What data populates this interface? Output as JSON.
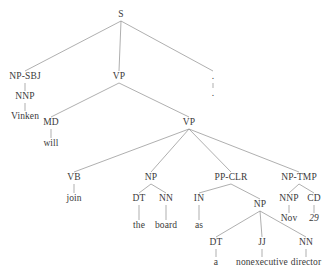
{
  "figure": {
    "type": "constituency-parse-tree",
    "sentence": "Vinken will join the board as a nonexecutive director Nov. 29 .",
    "background_color": "#ffffff",
    "line_color": "#8c8c8c",
    "text_color": "#3a3a3a"
  },
  "nodes": [
    {
      "id": "s",
      "label": "S",
      "kind": "nonterminal",
      "x": 121,
      "y": 15
    },
    {
      "id": "np-sbj",
      "label": "NP-SBJ",
      "kind": "nonterminal",
      "x": 25,
      "y": 77
    },
    {
      "id": "nnp-vinken",
      "label": "NNP",
      "kind": "nonterminal",
      "x": 25,
      "y": 97
    },
    {
      "id": "w-vinken",
      "label": "Vinken",
      "kind": "terminal",
      "x": 25,
      "y": 117
    },
    {
      "id": "vp-outer",
      "label": "VP",
      "kind": "nonterminal",
      "x": 119,
      "y": 77
    },
    {
      "id": "md",
      "label": "MD",
      "kind": "nonterminal",
      "x": 51,
      "y": 123
    },
    {
      "id": "w-will",
      "label": "will",
      "kind": "terminal",
      "x": 51,
      "y": 144
    },
    {
      "id": "vp-inner",
      "label": "VP",
      "kind": "nonterminal",
      "x": 189,
      "y": 123
    },
    {
      "id": "vb",
      "label": "VB",
      "kind": "nonterminal",
      "x": 74,
      "y": 178
    },
    {
      "id": "w-join",
      "label": "join",
      "kind": "terminal",
      "x": 74,
      "y": 199
    },
    {
      "id": "np-obj",
      "label": "NP",
      "kind": "nonterminal",
      "x": 151,
      "y": 178
    },
    {
      "id": "dt-the",
      "label": "DT",
      "kind": "nonterminal",
      "x": 139,
      "y": 199
    },
    {
      "id": "w-the",
      "label": "the",
      "kind": "terminal",
      "x": 139,
      "y": 226
    },
    {
      "id": "nn-board",
      "label": "NN",
      "kind": "nonterminal",
      "x": 166,
      "y": 199
    },
    {
      "id": "w-board",
      "label": "board",
      "kind": "terminal",
      "x": 166,
      "y": 226
    },
    {
      "id": "pp-clr",
      "label": "PP-CLR",
      "kind": "nonterminal",
      "x": 231,
      "y": 178
    },
    {
      "id": "in-as",
      "label": "IN",
      "kind": "nonterminal",
      "x": 199,
      "y": 199
    },
    {
      "id": "w-as",
      "label": "as",
      "kind": "terminal",
      "x": 199,
      "y": 226
    },
    {
      "id": "np-pred",
      "label": "NP",
      "kind": "nonterminal",
      "x": 260,
      "y": 205
    },
    {
      "id": "dt-a",
      "label": "DT",
      "kind": "nonterminal",
      "x": 216,
      "y": 243
    },
    {
      "id": "w-a",
      "label": "a",
      "kind": "terminal",
      "x": 216,
      "y": 263
    },
    {
      "id": "jj",
      "label": "JJ",
      "kind": "nonterminal",
      "x": 262,
      "y": 243
    },
    {
      "id": "w-nonexec",
      "label": "nonexecutive",
      "kind": "terminal",
      "x": 262,
      "y": 263
    },
    {
      "id": "nn-director",
      "label": "NN",
      "kind": "nonterminal",
      "x": 306,
      "y": 243
    },
    {
      "id": "w-director",
      "label": "director",
      "kind": "terminal",
      "x": 306,
      "y": 263
    },
    {
      "id": "np-tmp",
      "label": "NP-TMP",
      "kind": "nonterminal",
      "x": 299,
      "y": 178
    },
    {
      "id": "nnp-nov",
      "label": "NNP",
      "kind": "nonterminal",
      "x": 289,
      "y": 199
    },
    {
      "id": "w-nov",
      "label": "Nov",
      "kind": "terminal",
      "x": 289,
      "y": 219
    },
    {
      "id": "cd",
      "label": "CD",
      "kind": "nonterminal",
      "x": 314,
      "y": 199
    },
    {
      "id": "w-29",
      "label": "29",
      "kind": "terminal",
      "x": 314,
      "y": 219,
      "italic": true
    },
    {
      "id": "punct",
      "label": ".",
      "kind": "nonterminal",
      "x": 213,
      "y": 77
    },
    {
      "id": "w-punct",
      "label": ".",
      "kind": "terminal",
      "x": 213,
      "y": 94
    }
  ],
  "edges": [
    {
      "from": "s",
      "to": "np-sbj"
    },
    {
      "from": "s",
      "to": "vp-outer"
    },
    {
      "from": "s",
      "to": "punct"
    },
    {
      "from": "np-sbj",
      "to": "nnp-vinken"
    },
    {
      "from": "nnp-vinken",
      "to": "w-vinken"
    },
    {
      "from": "vp-outer",
      "to": "md"
    },
    {
      "from": "vp-outer",
      "to": "vp-inner"
    },
    {
      "from": "md",
      "to": "w-will"
    },
    {
      "from": "vp-inner",
      "to": "vb"
    },
    {
      "from": "vp-inner",
      "to": "np-obj"
    },
    {
      "from": "vp-inner",
      "to": "pp-clr"
    },
    {
      "from": "vp-inner",
      "to": "np-tmp"
    },
    {
      "from": "vb",
      "to": "w-join"
    },
    {
      "from": "np-obj",
      "to": "dt-the"
    },
    {
      "from": "np-obj",
      "to": "nn-board"
    },
    {
      "from": "dt-the",
      "to": "w-the"
    },
    {
      "from": "nn-board",
      "to": "w-board"
    },
    {
      "from": "pp-clr",
      "to": "in-as"
    },
    {
      "from": "pp-clr",
      "to": "np-pred"
    },
    {
      "from": "in-as",
      "to": "w-as"
    },
    {
      "from": "np-pred",
      "to": "dt-a"
    },
    {
      "from": "np-pred",
      "to": "jj"
    },
    {
      "from": "np-pred",
      "to": "nn-director"
    },
    {
      "from": "dt-a",
      "to": "w-a"
    },
    {
      "from": "jj",
      "to": "w-nonexec"
    },
    {
      "from": "nn-director",
      "to": "w-director"
    },
    {
      "from": "np-tmp",
      "to": "nnp-nov"
    },
    {
      "from": "np-tmp",
      "to": "cd"
    },
    {
      "from": "nnp-nov",
      "to": "w-nov"
    },
    {
      "from": "cd",
      "to": "w-29"
    },
    {
      "from": "punct",
      "to": "w-punct"
    }
  ]
}
